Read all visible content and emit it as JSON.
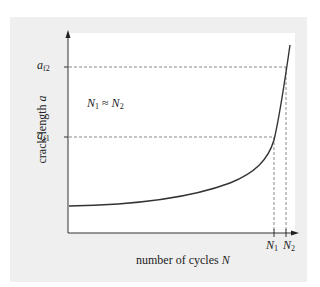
{
  "header": {
    "cut_text": "Fatigue crack"
  },
  "diagram": {
    "y_axis_label": "crack length",
    "y_axis_var": "a",
    "x_axis_label": "number of cycles",
    "x_axis_var": "N",
    "annotation_left": "N",
    "annotation_left_sub": "1",
    "annotation_rel": " ≈ ",
    "annotation_right": "N",
    "annotation_right_sub": "2",
    "y_ticks": [
      {
        "var": "a",
        "sub": "f2"
      },
      {
        "var": "a",
        "sub": "f1"
      }
    ],
    "x_ticks": [
      {
        "var": "N",
        "sub": "1"
      },
      {
        "var": "N",
        "sub": "2"
      }
    ],
    "colors": {
      "panel": "#efefef",
      "plot": "#ffffff",
      "line": "#333333",
      "dash": "#888888"
    }
  }
}
